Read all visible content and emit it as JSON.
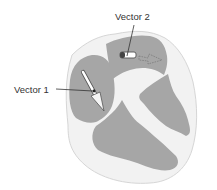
{
  "diagram": {
    "colors": {
      "outer_wall": "#f2f2f2",
      "outer_outline": "#d8d8d8",
      "chamber": "#a6a6a6",
      "leader_line": "#333333",
      "label_text": "#333333"
    },
    "labels": {
      "vector1": "Vector 1",
      "vector2": "Vector 2"
    },
    "vectors": [
      {
        "name": "Vector 1",
        "style": "solid",
        "direction": "down-right",
        "location": "left atrium / upper left chamber"
      },
      {
        "name": "Vector 2",
        "style": "dashed",
        "direction": "right",
        "location": "right upper chamber"
      }
    ]
  }
}
